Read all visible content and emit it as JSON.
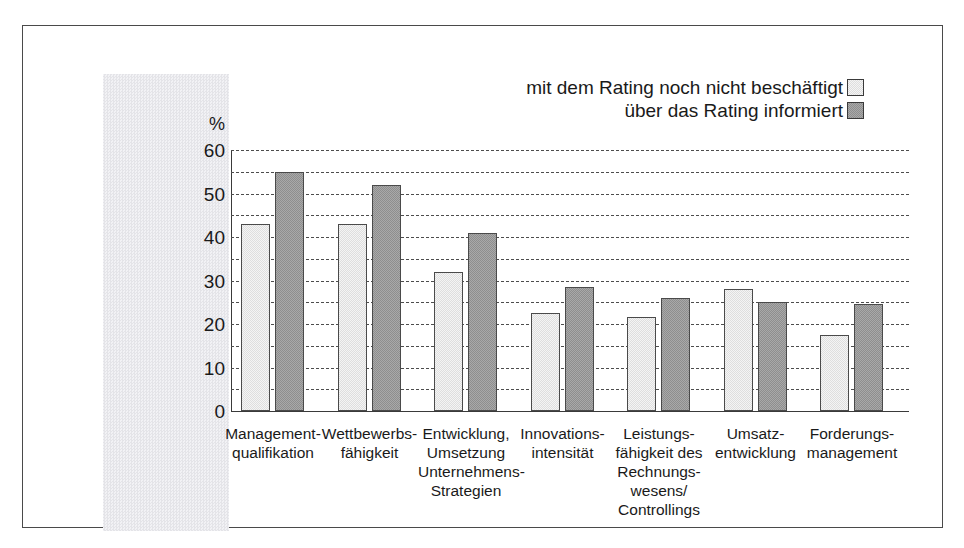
{
  "chart_data": {
    "type": "bar",
    "title": "",
    "subtitle": "",
    "xlabel": "",
    "ylabel": "%",
    "ylim": [
      0,
      60
    ],
    "ytick_labels": [
      "60",
      "50",
      "40",
      "30",
      "20",
      "10",
      "0"
    ],
    "ytick_values": [
      60,
      50,
      40,
      30,
      20,
      10,
      0
    ],
    "minor_gridlines": [
      55,
      45,
      35,
      25,
      15,
      5
    ],
    "grid": true,
    "legend_position": "top-right",
    "categories": [
      "Management-\nqualifikation",
      "Wettbewerbs-\nfähigkeit",
      "Entwicklung,\nUmsetzung\nUnternehmens-\nStrategien",
      "Innovations-\nintensität",
      "Leistungs-\nfähigkeit des\nRechnungs-\nwesens/\nControllings",
      "Umsatz-\nentwicklung",
      "Forderungs-\nmanagement"
    ],
    "series": [
      {
        "name": "mit dem Rating noch nicht beschäftigt",
        "color": "#e8e8e8",
        "values": [
          43,
          43,
          32,
          22.5,
          21.5,
          28,
          17.5
        ]
      },
      {
        "name": "über das Rating informiert",
        "color": "#999999",
        "values": [
          55,
          52,
          41,
          28.5,
          26,
          25,
          24.5
        ]
      }
    ]
  },
  "axis": {
    "unit_symbol": "%"
  },
  "legend": {
    "entries": [
      {
        "label": "mit dem Rating noch nicht beschäftigt",
        "swatch": "light-swatch-icon"
      },
      {
        "label": "über das Rating informiert",
        "swatch": "dark-swatch-icon"
      }
    ]
  },
  "category_labels": [
    [
      "Management-",
      "qualifikation"
    ],
    [
      "Wettbewerbs-",
      "fähigkeit"
    ],
    [
      "Entwicklung,",
      "Umsetzung",
      "Unternehmens-",
      "Strategien"
    ],
    [
      "Innovations-",
      "intensität"
    ],
    [
      "Leistungs-",
      "fähigkeit des",
      "Rechnungs-",
      "wesens/",
      "Controllings"
    ],
    [
      "Umsatz-",
      "entwicklung"
    ],
    [
      "Forderungs-",
      "management"
    ]
  ]
}
